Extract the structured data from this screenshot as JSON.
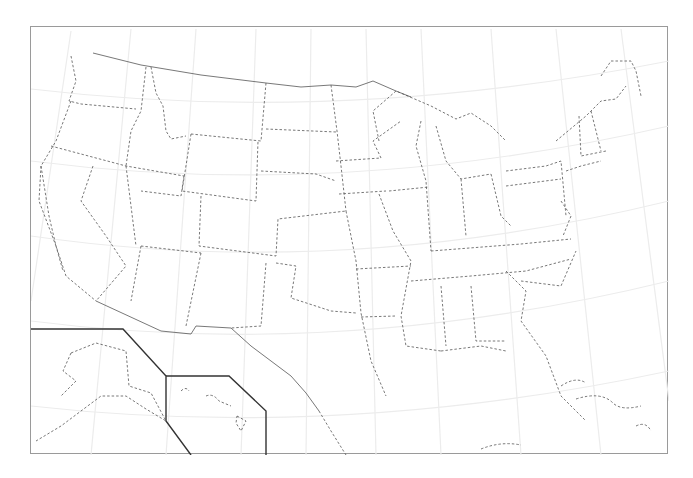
{
  "map": {
    "title": "",
    "subject": "United States state boundaries (Albers-style conic projection)",
    "insets": [
      "Alaska",
      "Hawaii"
    ],
    "style": {
      "state_line": "dashed",
      "national_border_line": "solid",
      "graticule_color": "#ececec",
      "line_color": "#555555",
      "frame_color": "#9a9a9a",
      "inset_line_color": "#333333"
    },
    "labels": []
  }
}
